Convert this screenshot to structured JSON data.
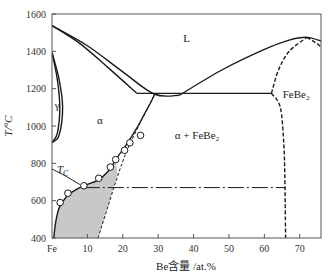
{
  "chart_data": {
    "type": "line",
    "title": "",
    "subtitle": "Fe-Be binary phase diagram",
    "xlabel": "Be含量 /at.%",
    "ylabel": "T/°C",
    "xlim": [
      0,
      76
    ],
    "ylim": [
      400,
      1600
    ],
    "grid": false,
    "x_ticks": [
      {
        "value": 0,
        "label": "Fe"
      },
      {
        "value": 10,
        "label": "10"
      },
      {
        "value": 20,
        "label": "20"
      },
      {
        "value": 30,
        "label": "30"
      },
      {
        "value": 40,
        "label": "40"
      },
      {
        "value": 50,
        "label": "50"
      },
      {
        "value": 60,
        "label": "60"
      },
      {
        "value": 70,
        "label": "70"
      }
    ],
    "y_ticks": [
      {
        "value": 400,
        "label": "400"
      },
      {
        "value": 600,
        "label": "600"
      },
      {
        "value": 800,
        "label": "800"
      },
      {
        "value": 1000,
        "label": "1000"
      },
      {
        "value": 1200,
        "label": "1200"
      },
      {
        "value": 1400,
        "label": "1400"
      },
      {
        "value": 1600,
        "label": "1600"
      }
    ],
    "region_labels": [
      {
        "text": "L",
        "x": 38,
        "y": 1450
      },
      {
        "text": "γ",
        "x": 1.5,
        "y": 1090
      },
      {
        "text": "α",
        "x": 13.5,
        "y": 1010
      },
      {
        "text": "α + FeBe₂",
        "x": 41,
        "y": 930
      },
      {
        "text": "FeBe₂",
        "x": 69,
        "y": 1150
      },
      {
        "text": "T",
        "sub": "C",
        "x": 3,
        "y": 750
      }
    ],
    "series": [
      {
        "name": "liquidus-left",
        "style": "solid",
        "points": [
          [
            0,
            1538
          ],
          [
            10,
            1430
          ],
          [
            20,
            1290
          ],
          [
            29,
            1170
          ],
          [
            36,
            1165
          ]
        ]
      },
      {
        "name": "solidus-alpha",
        "style": "solid",
        "points": [
          [
            0,
            1538
          ],
          [
            8,
            1440
          ],
          [
            16,
            1310
          ],
          [
            24,
            1175
          ]
        ]
      },
      {
        "name": "liquidus-right",
        "style": "solid",
        "points": [
          [
            36,
            1165
          ],
          [
            48,
            1300
          ],
          [
            60,
            1410
          ],
          [
            67,
            1460
          ],
          [
            72,
            1475
          ],
          [
            76,
            1455
          ]
        ]
      },
      {
        "name": "eutectic-isotherm",
        "style": "solid",
        "points": [
          [
            24,
            1175
          ],
          [
            62,
            1175
          ]
        ]
      },
      {
        "name": "FeBe2-left-boundary-upper",
        "style": "dashed",
        "points": [
          [
            62,
            1175
          ],
          [
            64,
            1300
          ],
          [
            67,
            1400
          ],
          [
            72,
            1475
          ]
        ]
      },
      {
        "name": "FeBe2-left-boundary-lower",
        "style": "dashed",
        "points": [
          [
            62,
            1175
          ],
          [
            64.5,
            1100
          ],
          [
            65.5,
            900
          ],
          [
            65.8,
            700
          ],
          [
            66,
            400
          ]
        ]
      },
      {
        "name": "FeBe2-right-boundary",
        "style": "dashed",
        "points": [
          [
            72,
            1475
          ],
          [
            75,
            1440
          ],
          [
            76,
            1420
          ]
        ]
      },
      {
        "name": "gamma-loop-outer",
        "style": "solid",
        "points": [
          [
            0,
            1394
          ],
          [
            2,
            1250
          ],
          [
            3,
            1100
          ],
          [
            2,
            950
          ],
          [
            0,
            912
          ]
        ]
      },
      {
        "name": "gamma-loop-inner",
        "style": "solid",
        "points": [
          [
            0,
            1394
          ],
          [
            1.5,
            1250
          ],
          [
            2.2,
            1100
          ],
          [
            1.5,
            960
          ],
          [
            0,
            912
          ]
        ]
      },
      {
        "name": "alpha-solvus",
        "style": "solid",
        "points": [
          [
            0.5,
            400
          ],
          [
            1,
            480
          ],
          [
            2,
            560
          ],
          [
            4,
            620
          ],
          [
            6,
            650
          ],
          [
            9,
            680
          ],
          [
            13,
            710
          ],
          [
            16,
            760
          ],
          [
            18,
            820
          ],
          [
            21,
            900
          ],
          [
            24,
            990
          ],
          [
            26,
            1060
          ],
          [
            28,
            1130
          ],
          [
            29,
            1170
          ]
        ]
      },
      {
        "name": "alpha-solvus-metastable",
        "style": "dashed",
        "points": [
          [
            13,
            400
          ],
          [
            15,
            520
          ],
          [
            18,
            700
          ],
          [
            21,
            860
          ],
          [
            25,
            1020
          ],
          [
            29,
            1170
          ]
        ]
      },
      {
        "name": "curie-temperature",
        "style": "solid",
        "points": [
          [
            0,
            770
          ],
          [
            4,
            730
          ],
          [
            8,
            685
          ]
        ]
      },
      {
        "name": "order-transition",
        "style": "dashdot",
        "points": [
          [
            9,
            670
          ],
          [
            66,
            670
          ]
        ]
      }
    ],
    "data_points": [
      [
        2.3,
        590
      ],
      [
        4.5,
        640
      ],
      [
        9,
        680
      ],
      [
        13.2,
        720
      ],
      [
        16.5,
        780
      ],
      [
        18,
        820
      ],
      [
        20.5,
        870
      ],
      [
        22,
        910
      ],
      [
        25,
        950
      ]
    ],
    "shaded_region": {
      "description": "ordered two-phase region (gray)",
      "color": "#c8c8c8",
      "points": [
        [
          0.5,
          400
        ],
        [
          1,
          480
        ],
        [
          2,
          560
        ],
        [
          4,
          620
        ],
        [
          6,
          650
        ],
        [
          9,
          680
        ],
        [
          13,
          710
        ],
        [
          16,
          760
        ],
        [
          18,
          820
        ],
        [
          18.5,
          740
        ],
        [
          15,
          520
        ],
        [
          13,
          400
        ]
      ]
    },
    "colors": {
      "line": "#1a1a1a",
      "shade": "#c8c8c8",
      "axis": "#555555",
      "marker_fill": "#ffffff"
    }
  }
}
